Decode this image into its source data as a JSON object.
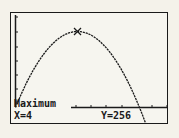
{
  "calculator_screen": {
    "mode": "graph",
    "result_label": "Maximum",
    "x_readout": "X=4",
    "y_readout": "Y=256"
  },
  "chart_data": {
    "type": "line",
    "title": "",
    "function_description": "downward parabola",
    "x": [
      0,
      1,
      2,
      3,
      4,
      5,
      6,
      7,
      8,
      8.5
    ],
    "values": [
      0,
      112,
      192,
      240,
      256,
      240,
      192,
      112,
      0,
      -68
    ],
    "annotations": [
      {
        "label": "Maximum",
        "x": 4,
        "y": 256,
        "marker": "cross"
      }
    ],
    "xlabel": "",
    "ylabel": "",
    "grid": false,
    "axis_ticks": true,
    "colors": {
      "curve": "#1a1a1a",
      "background": "#f6f5ef"
    }
  }
}
